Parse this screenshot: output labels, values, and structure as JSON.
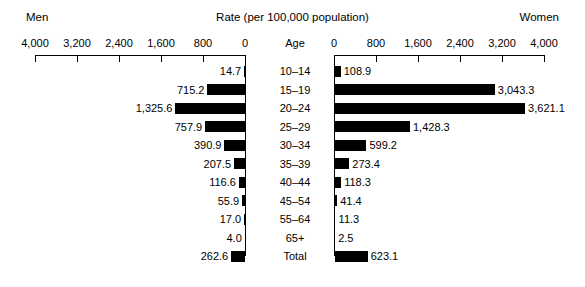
{
  "header": {
    "left_label": "Men",
    "title": "Rate (per 100,000 population)",
    "right_label": "Women",
    "age_column_header": "Age"
  },
  "axis": {
    "left_ticks": [
      "4,000",
      "3,200",
      "2,400",
      "1,600",
      "800",
      "0"
    ],
    "right_ticks": [
      "0",
      "800",
      "1,600",
      "2,400",
      "3,200",
      "4,000"
    ],
    "max": 4000,
    "tick_step": 800
  },
  "chart_data": {
    "type": "bar",
    "title": "Rate (per 100,000 population)",
    "subtitle": "",
    "xlabel": "Rate (per 100,000 population)",
    "ylabel": "Age",
    "xlim": [
      0,
      4000
    ],
    "grid": false,
    "legend_position": "top",
    "orientation": "horizontal-diverging",
    "categories": [
      "10–14",
      "15–19",
      "20–24",
      "25–29",
      "30–34",
      "35–39",
      "40–44",
      "45–54",
      "55–64",
      "65+",
      "Total"
    ],
    "series": [
      {
        "name": "Men",
        "side": "left",
        "values": [
          14.7,
          715.2,
          1325.6,
          757.9,
          390.9,
          207.5,
          116.6,
          55.9,
          17.0,
          4.0,
          262.6
        ],
        "labels": [
          "14.7",
          "715.2",
          "1,325.6",
          "757.9",
          "390.9",
          "207.5",
          "116.6",
          "55.9",
          "17.0",
          "4.0",
          "262.6"
        ]
      },
      {
        "name": "Women",
        "side": "right",
        "values": [
          108.9,
          3043.3,
          3621.1,
          1428.3,
          599.2,
          273.4,
          118.3,
          41.4,
          11.3,
          2.5,
          623.1
        ],
        "labels": [
          "108.9",
          "3,043.3",
          "3,621.1",
          "1,428.3",
          "599.2",
          "273.4",
          "118.3",
          "41.4",
          "11.3",
          "2.5",
          "623.1"
        ]
      }
    ]
  },
  "colors": {
    "bar": "#000000",
    "axis": "#000000",
    "background": "#ffffff"
  }
}
